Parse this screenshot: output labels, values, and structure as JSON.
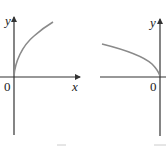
{
  "graphs": [
    {
      "name": "sqrt-x",
      "y_label": "y",
      "x_label": "x",
      "origin_label": "0",
      "description": "Graph of y = sqrt(x), curve rising to the right from origin"
    },
    {
      "name": "sqrt-neg-x",
      "y_label": "y",
      "origin_label": "0",
      "description": "Graph of y = sqrt(-x), curve rising to the left from origin"
    }
  ],
  "colors": {
    "axis": "#333333",
    "curve": "#8a8a8a",
    "text": "#222222"
  }
}
